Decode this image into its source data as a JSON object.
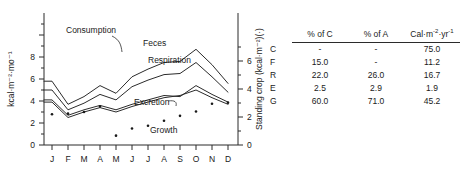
{
  "figure": {
    "left_axis_title": "kcal·m⁻²·mo⁻¹",
    "right_axis_title": "Standing crop (kcal·m⁻²)(·)",
    "left_ticks": [
      "0",
      "2",
      "4",
      "6",
      "8"
    ],
    "right_ticks": [
      "0",
      "2",
      "4",
      "6"
    ],
    "months": [
      "J",
      "F",
      "M",
      "A",
      "M",
      "J",
      "J",
      "A",
      "S",
      "O",
      "N",
      "D"
    ],
    "curve_labels": {
      "consumption": "Consumption",
      "feces": "Feces",
      "respiration": "Respiration",
      "excretion": "Excretion",
      "growth": "Growth"
    }
  },
  "chart_data": {
    "type": "line",
    "title": "",
    "xlabel": "",
    "ylabel": "kcal·m⁻²·mo⁻¹",
    "y2label": "Standing crop (kcal·m⁻²)(·)",
    "categories": [
      "J",
      "F",
      "M",
      "A",
      "M",
      "J",
      "J",
      "A",
      "S",
      "O",
      "N",
      "D"
    ],
    "ylim": [
      0,
      9
    ],
    "y2lim": [
      0,
      7.3
    ],
    "grid": false,
    "legend": "inline-labels",
    "series": [
      {
        "name": "Consumption",
        "type": "line",
        "values": [
          5.8,
          3.7,
          4.4,
          5.4,
          4.7,
          6.2,
          6.9,
          7.5,
          7.6,
          8.7,
          7.3,
          5.6
        ]
      },
      {
        "name": "Feces",
        "type": "line",
        "values": [
          5.0,
          3.2,
          3.8,
          4.6,
          4.1,
          5.3,
          5.9,
          6.4,
          6.5,
          7.5,
          6.2,
          4.8
        ]
      },
      {
        "name": "Respiration",
        "type": "line",
        "values": [
          4.1,
          2.7,
          3.2,
          3.6,
          3.2,
          3.7,
          4.1,
          4.5,
          4.4,
          5.4,
          4.6,
          3.9
        ]
      },
      {
        "name": "Excretion",
        "type": "line",
        "values": [
          3.9,
          2.5,
          3.0,
          3.4,
          3.0,
          3.5,
          3.9,
          4.3,
          4.5,
          5.0,
          4.3,
          3.7
        ]
      },
      {
        "name": "Growth",
        "type": "scatter",
        "values": [
          2.8,
          2.85,
          3.0,
          3.5,
          0.85,
          1.5,
          1.75,
          2.2,
          2.65,
          3.05,
          3.75,
          3.85
        ]
      }
    ]
  },
  "table": {
    "headers": [
      "",
      "% of C",
      "% of A",
      "Cal·m⁻²·yr⁻¹"
    ],
    "rows": [
      {
        "label": "C",
        "pct_c": "-",
        "pct_a": "-",
        "cal": "75.0"
      },
      {
        "label": "F",
        "pct_c": "15.0",
        "pct_a": "-",
        "cal": "11.2"
      },
      {
        "label": "R",
        "pct_c": "22.0",
        "pct_a": "26.0",
        "cal": "16.7"
      },
      {
        "label": "E",
        "pct_c": "2.5",
        "pct_a": "2.9",
        "cal": "1.9"
      },
      {
        "label": "G",
        "pct_c": "60.0",
        "pct_a": "71.0",
        "cal": "45.2"
      }
    ]
  }
}
